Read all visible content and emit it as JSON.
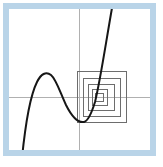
{
  "figure": {
    "canvas": {
      "width": 163,
      "height": 167,
      "background_color": "#ffffff"
    },
    "frame": {
      "name": "pale-blue-border",
      "color": "#b9d4e8",
      "inner_fill": "#ffffff",
      "x": 3,
      "y": 3,
      "width": 153,
      "height": 153,
      "thickness": 6
    },
    "plot_panel": {
      "x": 9,
      "y": 9,
      "width": 141,
      "height": 141,
      "background_color": "#ffffff"
    },
    "axes": {
      "color": "#b0b0b0",
      "stroke_width": 1,
      "x_axis": {
        "name": "horizontal-axis",
        "y": 97,
        "x_start": 9,
        "x_end": 150
      },
      "y_axis": {
        "name": "vertical-axis",
        "x": 79,
        "y_start": 9,
        "y_end": 150
      }
    },
    "curve": {
      "name": "cubic-curve",
      "color": "#161616",
      "stroke_width": 2.0,
      "path": "M 22 158 C 25 128, 30 96, 37 82 C 41 74, 46 71, 51 75 C 56 79, 60 92, 66 105 C 72 117, 78 123, 84 122 C 88 121, 91 115, 95 102 C 100 82, 105 48, 112 8",
      "features": {
        "local_maximum": {
          "x": 49,
          "y": 73
        },
        "local_minimum": {
          "x": 86,
          "y": 122
        },
        "root_near_zoom_center": {
          "x": 99,
          "y": 97
        },
        "enters_bottom_at_x": 22,
        "exits_top_at_x": 112
      }
    },
    "zoom_boxes": {
      "name": "nested-zoom-squares",
      "color": "#6d6d6d",
      "stroke_width": 1,
      "count": 5,
      "center": {
        "x": 99,
        "y": 97
      },
      "squares": [
        {
          "index": 1,
          "x": 77,
          "y": 71,
          "width": 50,
          "height": 52
        },
        {
          "index": 2,
          "x": 83,
          "y": 78,
          "width": 38,
          "height": 39
        },
        {
          "index": 3,
          "x": 88,
          "y": 84,
          "width": 27,
          "height": 27
        },
        {
          "index": 4,
          "x": 92,
          "y": 89,
          "width": 16,
          "height": 17
        },
        {
          "index": 5,
          "x": 95,
          "y": 93,
          "width": 9,
          "height": 9
        }
      ]
    }
  },
  "chart_data": {
    "type": "line",
    "subtitle": "",
    "xlabel": "",
    "ylabel": "",
    "grid": false,
    "legend": "none",
    "axis_ticks": [],
    "tick_labels": [],
    "annotations": [
      "nested zoom square 1",
      "nested zoom square 2",
      "nested zoom square 3",
      "nested zoom square 4",
      "nested zoom square 5"
    ],
    "axis_origin_px": {
      "x": 79,
      "y": 97
    },
    "xlim": [
      -2.9,
      2.6
    ],
    "ylim": [
      -3.0,
      3.0
    ],
    "series": [
      {
        "name": "cubic curve",
        "x": [
          -2.35,
          -2.1,
          -1.8,
          -1.55,
          -1.3,
          -1.05,
          -0.8,
          -0.55,
          -0.3,
          -0.05,
          0.2,
          0.45,
          0.7,
          0.85,
          1.0,
          1.15,
          1.3
        ],
        "y": [
          -2.6,
          -1.85,
          -0.95,
          -0.35,
          0.2,
          0.52,
          0.6,
          0.5,
          0.2,
          -0.2,
          -0.65,
          -1.0,
          -1.1,
          -0.95,
          -0.45,
          0.6,
          2.5
        ]
      }
    ],
    "zoom_box_bounds": [
      {
        "index": 1,
        "xmin": -0.07,
        "xmax": 1.88,
        "ymin": -1.01,
        "ymax": 1.01
      },
      {
        "index": 2,
        "xmin": 0.16,
        "xmax": 1.64,
        "ymin": -0.76,
        "ymax": 0.74
      },
      {
        "index": 3,
        "xmin": 0.35,
        "xmax": 1.41,
        "ymin": -0.54,
        "ymax": 0.51
      },
      {
        "index": 4,
        "xmin": 0.51,
        "xmax": 1.13,
        "ymin": -0.33,
        "ymax": 0.31
      },
      {
        "index": 5,
        "xmin": 0.62,
        "xmax": 0.97,
        "ymin": -0.18,
        "ymax": 0.16
      }
    ]
  }
}
